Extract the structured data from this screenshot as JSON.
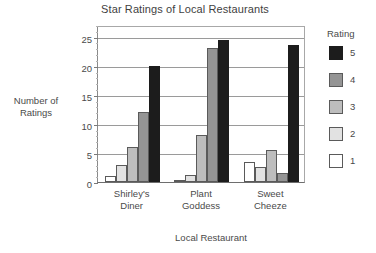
{
  "chart_data": {
    "type": "bar",
    "title": "Star Ratings of Local Restaurants",
    "xlabel": "Local Restaurant",
    "ylabel": "Number of Ratings",
    "categories": [
      "Shirley's Diner",
      "Plant Goddess",
      "Sweet Cheeze"
    ],
    "category_lines": [
      [
        "Shirley's",
        "Diner"
      ],
      [
        "Plant",
        "Goddess"
      ],
      [
        "Sweet",
        "Cheeze"
      ]
    ],
    "series": [
      {
        "name": "1",
        "color": "#ffffff",
        "values": [
          1,
          0,
          3.5
        ]
      },
      {
        "name": "2",
        "color": "#e2e2e2",
        "values": [
          3,
          1.2,
          2.5
        ]
      },
      {
        "name": "3",
        "color": "#bdbdbd",
        "values": [
          6,
          8,
          5.5
        ]
      },
      {
        "name": "4",
        "color": "#949494",
        "values": [
          12,
          23,
          1.5
        ]
      },
      {
        "name": "5",
        "color": "#1c1c1c",
        "values": [
          20,
          24.5,
          23.5
        ]
      }
    ],
    "legend_title": "Rating",
    "legend_order": [
      "5",
      "4",
      "3",
      "2",
      "1"
    ],
    "ylim": [
      0,
      27
    ],
    "yticks": [
      0,
      5,
      10,
      15,
      20,
      25
    ],
    "ytick_labels": [
      "0",
      "5",
      "10",
      "15",
      "20",
      "25"
    ],
    "grid": true,
    "legend_position": "right"
  }
}
